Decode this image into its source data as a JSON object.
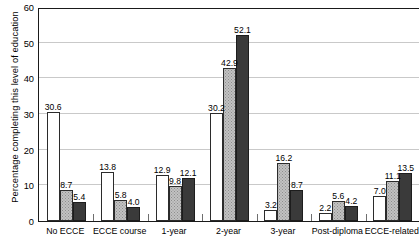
{
  "chart_data": {
    "type": "bar",
    "title": "",
    "xlabel": "",
    "ylabel": "Percentage completing this level of education",
    "ylim": [
      0,
      60
    ],
    "yticks": [
      0,
      10,
      20,
      30,
      40,
      50,
      60
    ],
    "grid": true,
    "legend": "none",
    "categories": [
      "No ECCE",
      "ECCE  course",
      "1-year",
      "2-year",
      "3-year",
      "Post-diploma",
      "ECCE-related"
    ],
    "series": [
      {
        "name": "series-1",
        "style": "white-outlined",
        "color": "#ffffff",
        "values": [
          30.6,
          13.8,
          12.9,
          30.2,
          3.2,
          2.2,
          7.0
        ],
        "labels": [
          "30.6",
          "13.8",
          "12.9",
          "30.2",
          "3.2",
          "2.2",
          "7.0"
        ]
      },
      {
        "name": "series-2",
        "style": "light-gray-stippled",
        "color": "#c2c2c2",
        "values": [
          8.7,
          5.8,
          9.8,
          42.9,
          16.2,
          5.6,
          11.1
        ],
        "labels": [
          "8.7",
          "5.8",
          "9.8",
          "42.9",
          "16.2",
          "5.6",
          "11.1"
        ]
      },
      {
        "name": "series-3",
        "style": "dark-gray-solid",
        "color": "#3a3a3a",
        "values": [
          5.4,
          4.0,
          12.1,
          52.1,
          8.7,
          4.2,
          13.5
        ],
        "labels": [
          "5.4",
          "4.0",
          "12.1",
          "52.1",
          "8.7",
          "4.2",
          "13.5"
        ]
      }
    ]
  }
}
